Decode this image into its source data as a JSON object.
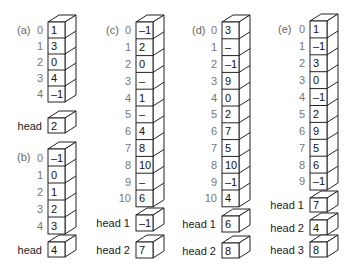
{
  "panels": [
    {
      "label": "(a)",
      "slots": [
        {
          "index": "0",
          "value": "1"
        },
        {
          "index": "1",
          "value": "3"
        },
        {
          "index": "2",
          "value": "0"
        },
        {
          "index": "3",
          "value": "4"
        },
        {
          "index": "4",
          "value": "–1"
        }
      ],
      "heads": [
        {
          "label": "head",
          "value": "2"
        }
      ]
    },
    {
      "label": "(b)",
      "slots": [
        {
          "index": "0",
          "value": "–1"
        },
        {
          "index": "1",
          "value": "0"
        },
        {
          "index": "2",
          "value": "1"
        },
        {
          "index": "3",
          "value": "2"
        },
        {
          "index": "4",
          "value": "3"
        }
      ],
      "heads": [
        {
          "label": "head",
          "value": "4"
        }
      ]
    },
    {
      "label": "(c)",
      "slots": [
        {
          "index": "0",
          "value": "–1"
        },
        {
          "index": "1",
          "value": "2"
        },
        {
          "index": "2",
          "value": "0"
        },
        {
          "index": "3",
          "value": "–"
        },
        {
          "index": "4",
          "value": "1"
        },
        {
          "index": "5",
          "value": "–"
        },
        {
          "index": "6",
          "value": "4"
        },
        {
          "index": "7",
          "value": "8"
        },
        {
          "index": "8",
          "value": "10"
        },
        {
          "index": "9",
          "value": "–"
        },
        {
          "index": "10",
          "value": "6"
        }
      ],
      "heads": [
        {
          "label": "head 1",
          "value": "–1"
        },
        {
          "label": "head 2",
          "value": "7"
        }
      ]
    },
    {
      "label": "(d)",
      "slots": [
        {
          "index": "0",
          "value": "3"
        },
        {
          "index": "1",
          "value": "–"
        },
        {
          "index": "2",
          "value": "–1"
        },
        {
          "index": "3",
          "value": "9"
        },
        {
          "index": "4",
          "value": "0"
        },
        {
          "index": "5",
          "value": "2"
        },
        {
          "index": "6",
          "value": "7"
        },
        {
          "index": "7",
          "value": "5"
        },
        {
          "index": "8",
          "value": "10"
        },
        {
          "index": "9",
          "value": "–1"
        },
        {
          "index": "10",
          "value": "4"
        }
      ],
      "heads": [
        {
          "label": "head 1",
          "value": "6"
        },
        {
          "label": "head 2",
          "value": "8"
        }
      ]
    },
    {
      "label": "(e)",
      "slots": [
        {
          "index": "0",
          "value": "1"
        },
        {
          "index": "1",
          "value": "–1"
        },
        {
          "index": "2",
          "value": "3"
        },
        {
          "index": "3",
          "value": "0"
        },
        {
          "index": "4",
          "value": "–1"
        },
        {
          "index": "5",
          "value": "2"
        },
        {
          "index": "6",
          "value": "9"
        },
        {
          "index": "7",
          "value": "5"
        },
        {
          "index": "8",
          "value": "6"
        },
        {
          "index": "9",
          "value": "–1"
        }
      ],
      "heads": [
        {
          "label": "head 1",
          "value": "7"
        },
        {
          "label": "head 2",
          "value": "4"
        },
        {
          "label": "head 3",
          "value": "8"
        }
      ]
    }
  ]
}
